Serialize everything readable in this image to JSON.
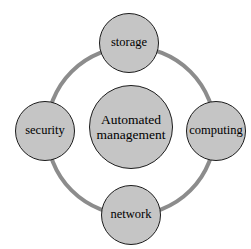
{
  "diagram": {
    "type": "hub-and-spoke-ring",
    "canvas": {
      "width": 251,
      "height": 249,
      "background": "#ffffff"
    },
    "ring": {
      "name": "connecting-ring",
      "center_x": 131,
      "center_y": 131,
      "radius": 84,
      "stroke_color": "#8c8c8c",
      "stroke_width": 4
    },
    "style": {
      "node_fill": "#c5c5c5",
      "node_border": "#1c1c1c",
      "text_color": "#000000"
    },
    "center_node": {
      "id": "automated-management",
      "label": "Automated management",
      "line1": "Automated",
      "line2": "management",
      "cx": 131,
      "cy": 127,
      "diameter": 84
    },
    "satellite_nodes": [
      {
        "id": "storage",
        "label": "storage",
        "position": "top",
        "cx": 129,
        "cy": 43,
        "diameter": 60
      },
      {
        "id": "computing",
        "label": "computing",
        "position": "right",
        "cx": 216,
        "cy": 131,
        "diameter": 60
      },
      {
        "id": "network",
        "label": "network",
        "position": "bottom",
        "cx": 131,
        "cy": 215,
        "diameter": 60
      },
      {
        "id": "security",
        "label": "security",
        "position": "left",
        "cx": 45,
        "cy": 131,
        "diameter": 60
      }
    ]
  }
}
